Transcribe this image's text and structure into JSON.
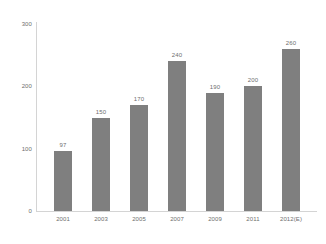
{
  "chart_data": {
    "type": "bar",
    "title": "",
    "subtitle": "",
    "xlabel": "",
    "ylabel": "",
    "categories": [
      "2001",
      "2003",
      "2005",
      "2007",
      "2009",
      "2011",
      "2012(E)"
    ],
    "values": [
      97,
      150,
      170,
      240,
      190,
      200,
      260
    ],
    "data_labels": [
      "97",
      "150",
      "170",
      "240",
      "190",
      "200",
      "260"
    ],
    "ylim": [
      0,
      300
    ],
    "y_ticks": [
      0,
      100,
      200,
      300
    ],
    "y_tick_labels": [
      "0",
      "100",
      "200",
      "300"
    ],
    "grid": false,
    "legend": false,
    "legend_position": "none",
    "annotations": [],
    "colors": {
      "bar": "#7f7f7f",
      "axis": "#d4d4d4",
      "text": "#6e6e6e",
      "background": "#ffffff"
    }
  }
}
